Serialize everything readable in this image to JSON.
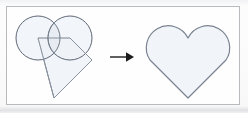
{
  "image": {
    "title": "Heart shape geometric construction",
    "width": 248,
    "height": 113,
    "background_color": "#fefefe",
    "frame_color": "#b9babd"
  },
  "colors": {
    "stroke": "#7a8490",
    "stroke_dark": "#5d6775",
    "fill": "#eef2f7",
    "fill_overlap": "#e2e8f0",
    "arrow": "#1c1c1c",
    "frame": "#b9babd"
  },
  "construction": {
    "label": "construction-figure",
    "description": "Two overlapping circles and a square rotated 45 degrees forming a heart",
    "shapes": [
      {
        "name": "left-circle",
        "type": "circle",
        "cx": 24,
        "cy": 26,
        "r": 22
      },
      {
        "name": "right-circle",
        "type": "circle",
        "cx": 56,
        "cy": 26,
        "r": 22
      },
      {
        "name": "rotated-square",
        "type": "polygon",
        "points": "24,26 56,26 78,48 40,86"
      }
    ]
  },
  "arrow": {
    "label": "transformation-arrow",
    "direction": "right",
    "symbol": "→"
  },
  "result": {
    "label": "result-figure",
    "description": "Resulting heart shape outline",
    "shape_name": "heart"
  }
}
